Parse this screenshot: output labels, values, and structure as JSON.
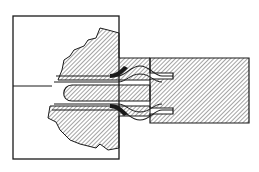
{
  "figure": {
    "type": "mechanical-cross-section",
    "colors": {
      "background": "#ffffff",
      "stroke": "#1a1a1a",
      "hatch": "#333333"
    },
    "parts": [
      {
        "name": "left-block-outline"
      },
      {
        "name": "fractured-hatched-region"
      },
      {
        "name": "right-hatched-bar"
      },
      {
        "name": "tongue"
      },
      {
        "name": "bulge-clamp"
      }
    ]
  }
}
